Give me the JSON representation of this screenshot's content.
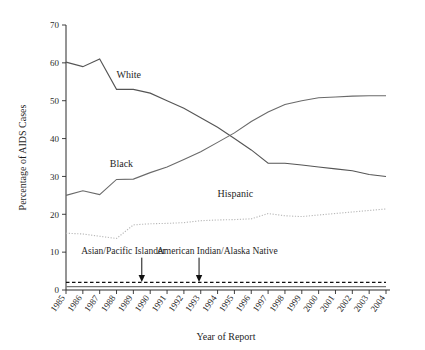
{
  "chart_data": {
    "type": "line",
    "title": "",
    "xlabel": "Year of Report",
    "ylabel": "Percentage of AIDS Cases",
    "xlim": [
      1985,
      2004
    ],
    "ylim": [
      0,
      70
    ],
    "yticks": [
      0,
      10,
      20,
      30,
      40,
      50,
      60,
      70
    ],
    "grid": false,
    "legend": "inline-labels",
    "x": [
      1985,
      1986,
      1987,
      1988,
      1989,
      1990,
      1991,
      1992,
      1993,
      1994,
      1995,
      1996,
      1997,
      1998,
      1999,
      2000,
      2001,
      2002,
      2003,
      2004
    ],
    "xticklabels": [
      "1985",
      "1986",
      "1987",
      "1988",
      "1989",
      "1990",
      "1991",
      "1992",
      "1993",
      "1994",
      "1995",
      "1996",
      "1997",
      "1998",
      "1999",
      "2000",
      "2001",
      "2002",
      "2003",
      "2004"
    ],
    "series": [
      {
        "name": "White",
        "color": "#555555",
        "style": "solid",
        "label_x": 1988.0,
        "label_y": 56.0,
        "values": [
          60.2,
          59.0,
          61.0,
          53.0,
          53.0,
          52.0,
          50.0,
          48.0,
          45.5,
          43.0,
          40.0,
          37.0,
          33.5,
          33.5,
          33.0,
          32.5,
          32.0,
          31.5,
          30.5,
          30.0
        ]
      },
      {
        "name": "Black",
        "color": "#6a6a6a",
        "style": "solid",
        "label_x": 1987.6,
        "label_y": 32.5,
        "values": [
          25.0,
          26.2,
          25.2,
          29.2,
          29.3,
          31.0,
          32.5,
          34.5,
          36.5,
          39.0,
          41.5,
          44.5,
          47.0,
          49.0,
          50.0,
          50.8,
          51.0,
          51.2,
          51.3,
          51.3
        ]
      },
      {
        "name": "Hispanic",
        "color": "#b8b8b8",
        "style": "dotted",
        "label_x": 1994.0,
        "label_y": 24.5,
        "values": [
          15.0,
          14.8,
          14.2,
          13.6,
          17.2,
          17.5,
          17.6,
          17.8,
          18.3,
          18.5,
          18.6,
          18.8,
          20.2,
          19.6,
          19.4,
          19.8,
          20.2,
          20.6,
          21.0,
          21.4
        ]
      },
      {
        "name": "American Indian/Alaska Native",
        "color": "#111111",
        "style": "dashed",
        "annotation_arrow_x": 1989.5,
        "label_x": 1995.5,
        "label_y": 10.0,
        "values": [
          2.0,
          2.0,
          2.0,
          2.0,
          2.0,
          2.0,
          2.0,
          2.0,
          2.0,
          2.0,
          2.0,
          2.0,
          2.0,
          2.0,
          2.0,
          2.0,
          2.0,
          2.0,
          2.0,
          2.0
        ]
      },
      {
        "name": "Asian/Pacific Islander",
        "color": "#777777",
        "style": "solid",
        "annotation_arrow_x": 1989.5,
        "label_x": 1987.0,
        "label_y": 10.0,
        "values": [
          0.9,
          0.9,
          0.9,
          0.9,
          0.9,
          0.9,
          0.9,
          0.9,
          0.9,
          0.9,
          0.9,
          0.9,
          0.9,
          0.9,
          0.9,
          0.9,
          0.9,
          0.9,
          0.9,
          0.9
        ]
      }
    ],
    "annotations": [
      {
        "text": "Asian/Pacific Islander",
        "arrow_x": 1989.5,
        "text_x": 1985.9,
        "text_y": 9.6
      },
      {
        "text": "American Indian/Alaska Native",
        "arrow_x": 1992.9,
        "text_x": 1990.4,
        "text_y": 9.6
      }
    ]
  }
}
